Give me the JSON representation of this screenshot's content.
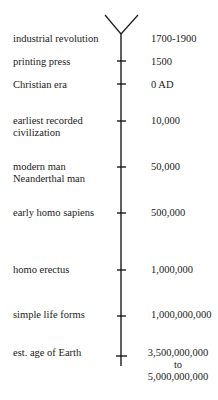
{
  "diagram": {
    "type": "timeline",
    "axis_color": "#1a1a1a",
    "events": [
      {
        "label": [
          "industrial revolution"
        ],
        "value": [
          "1700-1900"
        ],
        "y": 34
      },
      {
        "label": [
          "printing press"
        ],
        "value": [
          "1500"
        ],
        "y": 61
      },
      {
        "label": [
          "Christian era"
        ],
        "value": [
          "0 AD"
        ],
        "y": 84
      },
      {
        "label": [
          "earliest recorded",
          "civilization"
        ],
        "value": [
          "10,000"
        ],
        "y": 121
      },
      {
        "label": [
          "modern man",
          "Neanderthal man"
        ],
        "value": [
          "50,000"
        ],
        "y": 167
      },
      {
        "label": [
          "early homo sapiens"
        ],
        "value": [
          "500,000"
        ],
        "y": 213
      },
      {
        "label": [
          "homo erectus"
        ],
        "value": [
          "1,000,000"
        ],
        "y": 270
      },
      {
        "label": [
          "simple life forms"
        ],
        "value": [
          "1,000,000,000"
        ],
        "y": 316
      },
      {
        "label": [
          "est. age of Earth"
        ],
        "value": [
          "3,500,000,000",
          "to",
          "5,000,000,000"
        ],
        "y": 356
      }
    ]
  }
}
